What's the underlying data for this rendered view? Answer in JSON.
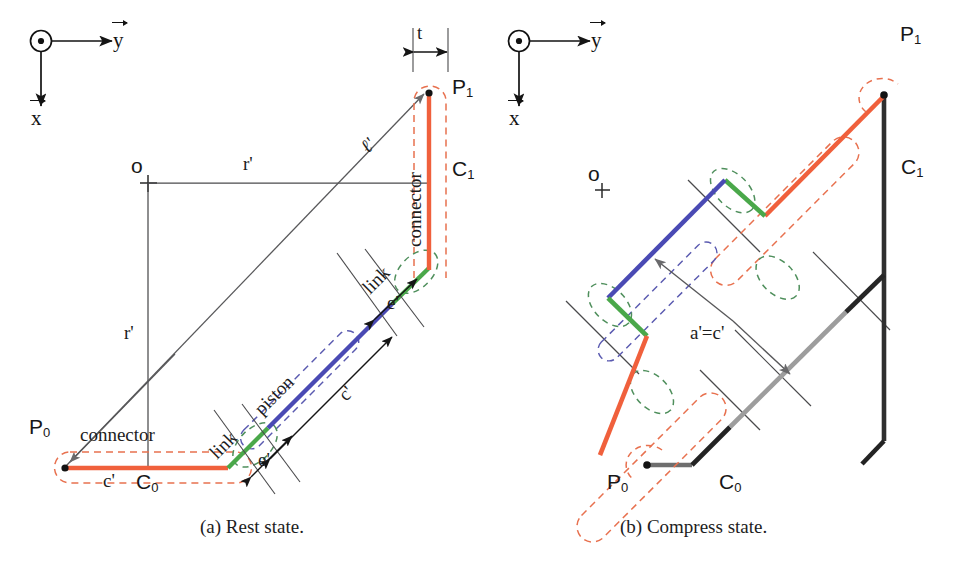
{
  "figure": {
    "kind": "engineering-line-diagram",
    "captions": [
      {
        "id": "a",
        "text": "(a) Rest state."
      },
      {
        "id": "b",
        "text": "(b) Compress state."
      }
    ]
  },
  "axes_triads": [
    {
      "id": "axes-a",
      "out_of_page_symbol": "z-out-of-page-circle-dot",
      "horizontal_label": "y",
      "vertical_label": "x"
    },
    {
      "id": "axes-b",
      "out_of_page_symbol": "z-out-of-page-circle-dot",
      "horizontal_label": "y",
      "vertical_label": "x"
    }
  ],
  "panel_a": {
    "origin_label": "o",
    "points": [
      {
        "name": "P",
        "sub": "1"
      },
      {
        "name": "P",
        "sub": "0"
      },
      {
        "name": "C",
        "sub": "1"
      },
      {
        "name": "C",
        "sub": "0"
      }
    ],
    "dimensions": [
      {
        "id": "t",
        "text": "t"
      },
      {
        "id": "r-horiz",
        "text": "r'"
      },
      {
        "id": "r-vert",
        "text": "r'"
      },
      {
        "id": "ell",
        "text": "ℓ'"
      },
      {
        "id": "c-bottom",
        "text": "c'"
      },
      {
        "id": "c-piston",
        "text": "c'"
      },
      {
        "id": "e-lower",
        "text": "e'"
      },
      {
        "id": "e-upper",
        "text": "e'"
      }
    ],
    "parts": [
      {
        "id": "connector-bottom",
        "text": "connector"
      },
      {
        "id": "connector-right",
        "text": "connector"
      },
      {
        "id": "link-lower",
        "text": "link"
      },
      {
        "id": "link-upper",
        "text": "link"
      },
      {
        "id": "piston",
        "text": "piston"
      }
    ]
  },
  "panel_b": {
    "origin_label": "o",
    "points": [
      {
        "name": "P",
        "sub": "1"
      },
      {
        "name": "P",
        "sub": "0"
      },
      {
        "name": "C",
        "sub": "1"
      },
      {
        "name": "C",
        "sub": "0"
      }
    ],
    "dimensions": [
      {
        "id": "a-equals-c",
        "text": "a'=c'"
      }
    ]
  },
  "colors": {
    "connector_orange": "#f0603c",
    "link_green": "#4aa84a",
    "piston_blue": "#4a4ab4",
    "dash_orange": "#e8714f",
    "dash_green": "#4f8f5c",
    "dash_blue": "#5a5ab0",
    "construction_gray": "#58585a",
    "body_dark": "#2a2a2a",
    "body_mid": "#8a8a8a",
    "text": "#1a1a1a"
  }
}
